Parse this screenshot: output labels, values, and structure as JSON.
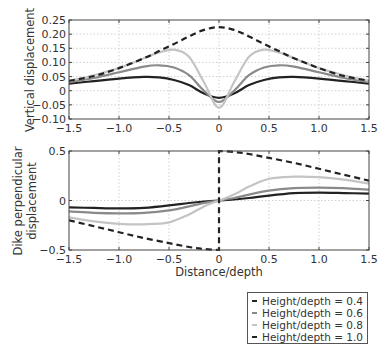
{
  "chart_data": [
    {
      "type": "line",
      "title": "",
      "xlabel": "",
      "ylabel": "Vertical displacement",
      "xlim": [
        -1.5,
        1.5
      ],
      "ylim": [
        -0.1,
        0.25
      ],
      "xticks": [
        "-1.5",
        "-1.0",
        "-0.5",
        "0",
        "0.5",
        "1.0",
        "1.5"
      ],
      "yticks": [
        "-0.10",
        "-0.05",
        "0",
        "0.05",
        "0.10",
        "0.15",
        "0.20",
        "0.25"
      ],
      "grid": true,
      "x": [
        -1.5,
        -1.25,
        -1.0,
        -0.75,
        -0.6,
        -0.45,
        -0.3,
        -0.15,
        0,
        0.15,
        0.3,
        0.45,
        0.6,
        0.75,
        1.0,
        1.25,
        1.5
      ],
      "series": [
        {
          "name": "Height/depth = 0.4",
          "style": "solid",
          "color": "#222222",
          "values": [
            0.025,
            0.034,
            0.043,
            0.049,
            0.047,
            0.038,
            0.02,
            -0.01,
            -0.025,
            -0.01,
            0.02,
            0.038,
            0.047,
            0.049,
            0.043,
            0.034,
            0.025
          ]
        },
        {
          "name": "Height/depth = 0.6",
          "style": "solid",
          "color": "#8a8a8a",
          "values": [
            0.03,
            0.045,
            0.065,
            0.085,
            0.09,
            0.082,
            0.055,
            0.0,
            -0.04,
            0.0,
            0.055,
            0.082,
            0.09,
            0.085,
            0.065,
            0.045,
            0.03
          ]
        },
        {
          "name": "Height/depth = 0.8",
          "style": "solid",
          "color": "#c4c4c4",
          "values": [
            0.035,
            0.055,
            0.08,
            0.115,
            0.135,
            0.145,
            0.12,
            0.03,
            -0.06,
            0.03,
            0.12,
            0.145,
            0.135,
            0.115,
            0.08,
            0.055,
            0.035
          ]
        },
        {
          "name": "Height/depth = 1.0",
          "style": "dashed",
          "color": "#222222",
          "values": [
            0.035,
            0.052,
            0.08,
            0.115,
            0.14,
            0.165,
            0.192,
            0.215,
            0.225,
            0.215,
            0.192,
            0.165,
            0.14,
            0.115,
            0.08,
            0.052,
            0.035
          ]
        }
      ]
    },
    {
      "type": "line",
      "title": "",
      "xlabel": "Distance/depth",
      "ylabel": "Dike perpendicular displacement",
      "xlim": [
        -1.5,
        1.5
      ],
      "ylim": [
        -0.5,
        0.5
      ],
      "xticks": [
        "-1.5",
        "-1.0",
        "-0.5",
        "0",
        "0.5",
        "1.0",
        "1.5"
      ],
      "yticks": [
        "-0.5",
        "0",
        "0.5"
      ],
      "grid": true,
      "x": [
        -1.5,
        -1.25,
        -1.0,
        -0.75,
        -0.5,
        -0.3,
        -0.15,
        0,
        0.15,
        0.3,
        0.5,
        0.75,
        1.0,
        1.25,
        1.5
      ],
      "series": [
        {
          "name": "Height/depth = 0.4",
          "style": "solid",
          "color": "#222222",
          "values": [
            -0.07,
            -0.075,
            -0.08,
            -0.075,
            -0.05,
            -0.025,
            -0.01,
            0,
            0.01,
            0.025,
            0.05,
            0.075,
            0.08,
            0.075,
            0.07
          ]
        },
        {
          "name": "Height/depth = 0.6",
          "style": "solid",
          "color": "#8a8a8a",
          "values": [
            -0.11,
            -0.125,
            -0.13,
            -0.125,
            -0.1,
            -0.06,
            -0.025,
            0,
            0.025,
            0.06,
            0.1,
            0.125,
            0.13,
            0.125,
            0.11
          ]
        },
        {
          "name": "Height/depth = 0.8",
          "style": "solid",
          "color": "#c4c4c4",
          "values": [
            -0.17,
            -0.21,
            -0.235,
            -0.24,
            -0.22,
            -0.14,
            -0.06,
            0,
            0.06,
            0.14,
            0.22,
            0.24,
            0.235,
            0.21,
            0.17
          ]
        },
        {
          "name": "Height/depth = 1.0",
          "style": "dashed",
          "color": "#222222",
          "values": [
            -0.2,
            -0.26,
            -0.32,
            -0.38,
            -0.43,
            -0.47,
            -0.49,
            -0.5,
            0.49,
            0.47,
            0.43,
            0.38,
            0.32,
            0.26,
            0.2
          ],
          "note": "jumps from -0.5 to +0.5 at x=0"
        }
      ]
    }
  ],
  "legend": {
    "entries": [
      {
        "label": "Height/depth = 0.4",
        "style": "solid",
        "color": "#222222"
      },
      {
        "label": "Height/depth = 0.6",
        "style": "solid",
        "color": "#8a8a8a"
      },
      {
        "label": "Height/depth = 0.8",
        "style": "solid",
        "color": "#c4c4c4"
      },
      {
        "label": "Height/depth = 1.0",
        "style": "dashed",
        "color": "#222222"
      }
    ]
  }
}
